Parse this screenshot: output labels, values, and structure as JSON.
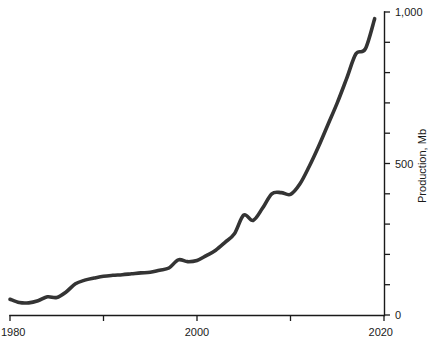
{
  "chart_data": {
    "type": "line",
    "title": "",
    "xlabel": "",
    "ylabel": "Production, Mb",
    "xlim": [
      1980,
      2020
    ],
    "ylim": [
      0,
      1000
    ],
    "grid": false,
    "legend": null,
    "x_tick_values": [
      1980,
      1990,
      2000,
      2010,
      2020
    ],
    "x_tick_labels": [
      "1980",
      "",
      "2000",
      "",
      "2020"
    ],
    "y_tick_values": [
      0,
      100,
      200,
      300,
      400,
      500,
      600,
      700,
      800,
      900,
      1000
    ],
    "y_tick_labels": [
      "0",
      "",
      "",
      "",
      "",
      "500",
      "",
      "",
      "",
      "",
      "1,000"
    ],
    "y_axis_position": "right",
    "series": [
      {
        "name": "Production",
        "color": "#343434",
        "x": [
          1980,
          1981,
          1982,
          1983,
          1984,
          1985,
          1986,
          1987,
          1988,
          1989,
          1990,
          1991,
          1992,
          1993,
          1994,
          1995,
          1996,
          1997,
          1998,
          1999,
          2000,
          2001,
          2002,
          2003,
          2004,
          2005,
          2006,
          2007,
          2008,
          2009,
          2010,
          2011,
          2012,
          2013,
          2014,
          2015,
          2016,
          2017,
          2018,
          2019
        ],
        "values": [
          52,
          41,
          40,
          47,
          60,
          58,
          76,
          103,
          115,
          122,
          128,
          131,
          133,
          136,
          139,
          141,
          148,
          155,
          182,
          176,
          180,
          196,
          214,
          240,
          268,
          330,
          312,
          352,
          400,
          404,
          398,
          432,
          490,
          556,
          628,
          700,
          780,
          862,
          878,
          978
        ]
      }
    ]
  },
  "axis_labels": {
    "x_start": "1980",
    "x_mid": "2000",
    "x_end": "2020",
    "y_zero": "0",
    "y_mid": "500",
    "y_top": "1,000",
    "y_title": "Production, Mb"
  }
}
